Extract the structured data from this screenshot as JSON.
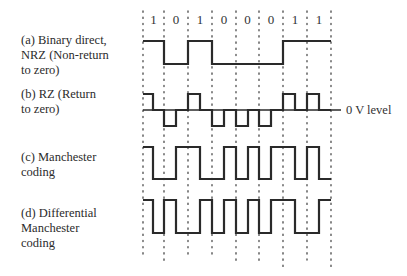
{
  "figure": {
    "bits": [
      "1",
      "0",
      "1",
      "0",
      "0",
      "0",
      "1",
      "1"
    ],
    "zero_level_label": "0 V level",
    "encodings": [
      {
        "id": "nrz",
        "label": "(a) Binary direct,\nNRZ (Non-return\nto zero)"
      },
      {
        "id": "rz",
        "label": "(b) RZ (Return\nto zero)"
      },
      {
        "id": "manchester",
        "label": "(c) Manchester\ncoding"
      },
      {
        "id": "diff_manchester",
        "label": "(d) Differential\nManchester\ncoding"
      }
    ],
    "colors": {
      "waveform": "#2a2a2a",
      "grid": "#555555",
      "text": "#2b2b2b"
    }
  }
}
